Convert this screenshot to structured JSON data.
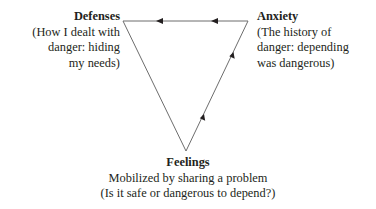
{
  "diagram": {
    "type": "triangle-of-conflict",
    "colors": {
      "line": "#6d6d6d",
      "text": "#231f20",
      "arrow": "#231f20"
    },
    "nodes": {
      "defenses": {
        "title": "Defenses",
        "lines": [
          "(How I dealt with",
          "danger: hiding",
          "my needs)"
        ]
      },
      "anxiety": {
        "title": "Anxiety",
        "lines": [
          "(The history of",
          "danger: depending",
          "was dangerous)"
        ]
      },
      "feelings": {
        "title": "Feelings",
        "lines": [
          "Mobilized by sharing a problem",
          "(Is it safe or dangerous to depend?)"
        ]
      }
    },
    "edges": [
      {
        "from": "feelings",
        "to": "anxiety",
        "arrows": 2
      },
      {
        "from": "anxiety",
        "to": "defenses",
        "arrows": 2
      },
      {
        "from": "defenses",
        "to": "feelings",
        "arrows": 0
      }
    ]
  }
}
